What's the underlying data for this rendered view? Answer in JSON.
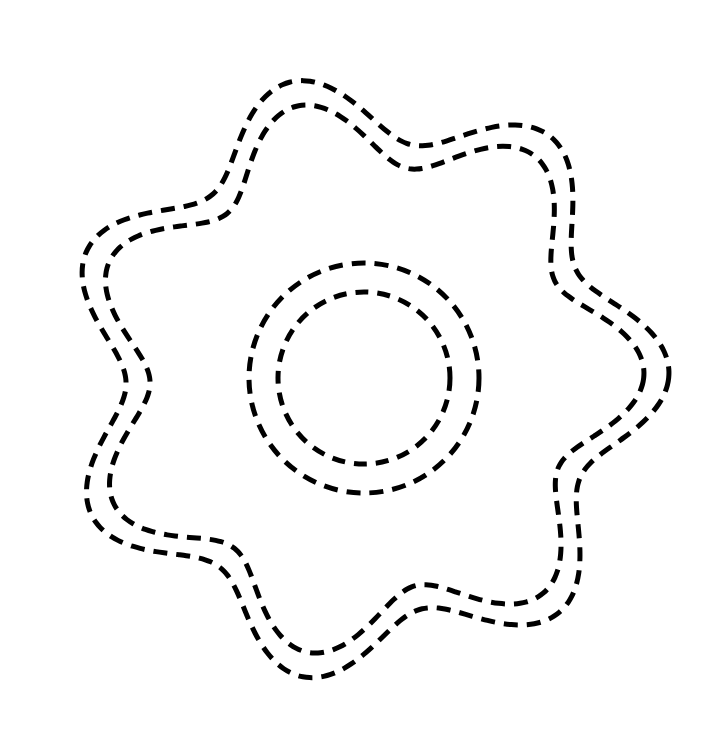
{
  "page": {
    "background_color": "#ffffff",
    "width": 720,
    "height": 741
  },
  "figure": {
    "name": "seven-lobed-scalloped-ring",
    "stroke_color": "#000000",
    "center": {
      "x": 364,
      "y": 378
    },
    "lobe_count": 7,
    "shapes": [
      {
        "name": "outer-scallop-outline",
        "type": "scallop",
        "lobes": 7,
        "outer_radius": 305,
        "inner_radius": 238,
        "rotation_deg": -104,
        "stroke_width": 5,
        "dash": "14 9"
      },
      {
        "name": "inner-scallop-outline",
        "type": "scallop",
        "lobes": 7,
        "outer_radius": 280,
        "inner_radius": 214,
        "rotation_deg": -104,
        "stroke_width": 5,
        "dash": "14 9"
      },
      {
        "name": "outer-center-circle",
        "type": "circle",
        "radius": 115,
        "stroke_width": 5,
        "dash": "14 9"
      },
      {
        "name": "inner-center-circle",
        "type": "circle",
        "radius": 86,
        "stroke_width": 5,
        "dash": "13 9"
      }
    ]
  }
}
